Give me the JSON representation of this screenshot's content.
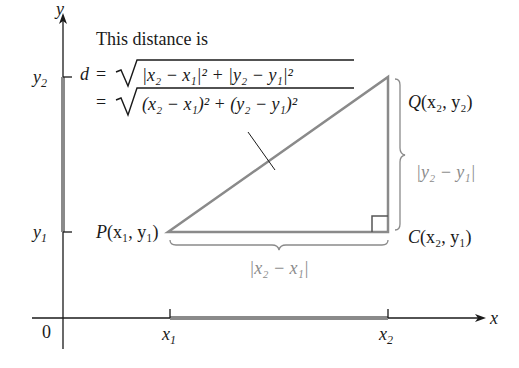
{
  "figure": {
    "caption_intro": "This distance is",
    "formula_line1": {
      "lhs": "d",
      "eq": "=",
      "radicand": "|x₂ − x₁|² + |y₂ − y₁|²"
    },
    "formula_line2": {
      "eq": "=",
      "radicand": "(x₂ − x₁)² + (y₂ − y₁)²"
    },
    "axes": {
      "x_label": "x",
      "y_label": "y",
      "origin_label": "0",
      "x_ticks": [
        {
          "base": "x",
          "sub": "1"
        },
        {
          "base": "x",
          "sub": "2"
        }
      ],
      "y_ticks": [
        {
          "base": "y",
          "sub": "2"
        },
        {
          "base": "y",
          "sub": "1"
        }
      ]
    },
    "points": {
      "P": {
        "name": "P",
        "coords": "(x₁, y₁)"
      },
      "Q": {
        "name": "Q",
        "coords": "(x₂, y₂)"
      },
      "C": {
        "name": "C",
        "coords": "(x₂, y₁)"
      }
    },
    "brace_labels": {
      "horizontal": "|x₂ − x₁|",
      "vertical": "|y₂ − y₁|"
    },
    "colors": {
      "axis": "#1a1a1a",
      "triangle": "#8a8a8a",
      "highlight_segment": "#8a8a8a",
      "brace_text": "#8c8c8c"
    }
  }
}
